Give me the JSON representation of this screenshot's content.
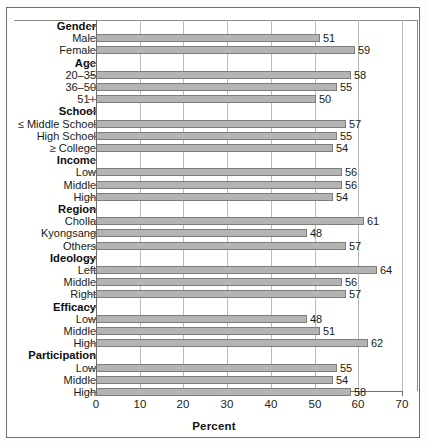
{
  "chart_data": {
    "type": "bar",
    "orientation": "horizontal",
    "title": "",
    "xlabel": "Percent",
    "ylabel": "",
    "xlim": [
      0,
      70
    ],
    "xticks": [
      0,
      10,
      20,
      30,
      40,
      50,
      60,
      70
    ],
    "grid": true,
    "legend": "none",
    "bar_color": "#b4b4b4",
    "bar_edge_color": "#7d7d7d",
    "groups": [
      {
        "name": "Gender",
        "categories": [
          "Male",
          "Female"
        ],
        "values": [
          51,
          59
        ]
      },
      {
        "name": "Age",
        "categories": [
          "20–35",
          "36–50",
          "51+"
        ],
        "values": [
          58,
          55,
          50
        ]
      },
      {
        "name": "School",
        "categories": [
          "≤ Middle School",
          "High School",
          "≥ College"
        ],
        "values": [
          57,
          55,
          54
        ]
      },
      {
        "name": "Income",
        "categories": [
          "Low",
          "Middle",
          "High"
        ],
        "values": [
          56,
          56,
          54
        ]
      },
      {
        "name": "Region",
        "categories": [
          "Cholla",
          "Kyongsang",
          "Others"
        ],
        "values": [
          61,
          48,
          57
        ]
      },
      {
        "name": "Ideology",
        "categories": [
          "Left",
          "Middle",
          "Right"
        ],
        "values": [
          64,
          56,
          57
        ]
      },
      {
        "name": "Efficacy",
        "categories": [
          "Low",
          "Middle",
          "High"
        ],
        "values": [
          48,
          51,
          62
        ]
      },
      {
        "name": "Participation",
        "categories": [
          "Low",
          "Middle",
          "High"
        ],
        "values": [
          55,
          54,
          58
        ]
      }
    ]
  }
}
